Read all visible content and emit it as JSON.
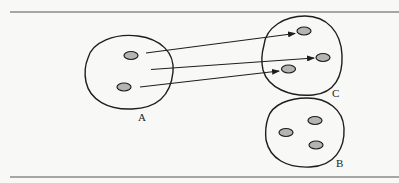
{
  "diagram": {
    "colors": {
      "background": "#f8f8f6",
      "stroke": "#1e1e1e",
      "oval_fill": "#b4b4b4",
      "rule": "#555555"
    },
    "sets": [
      {
        "id": "A",
        "label": "A",
        "element_count": 2
      },
      {
        "id": "C",
        "label": "C",
        "element_count": 3
      },
      {
        "id": "B",
        "label": "B",
        "element_count": 3
      }
    ],
    "arrows": [
      {
        "from": "A",
        "to": "C",
        "target_element": "top"
      },
      {
        "from": "A",
        "to": "C",
        "target_element": "right"
      },
      {
        "from": "A",
        "to": "C",
        "target_element": "lower-left"
      }
    ]
  }
}
